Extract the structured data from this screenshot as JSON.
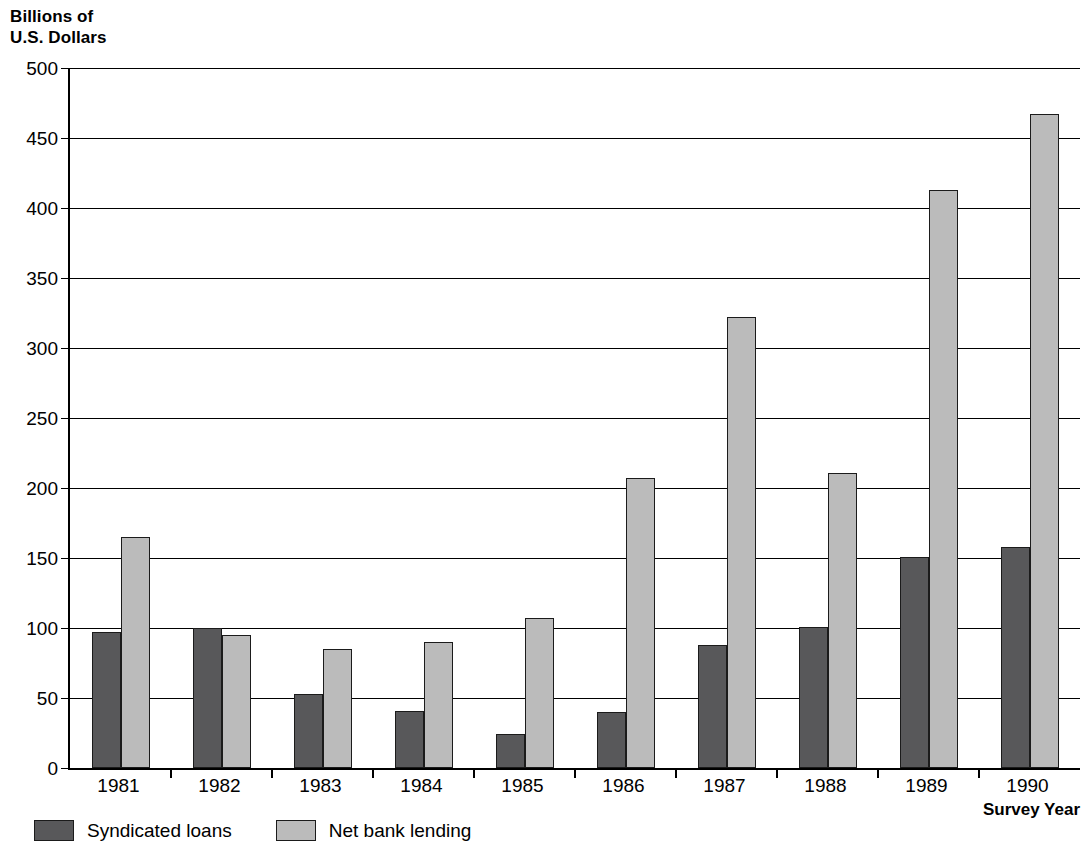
{
  "chart_data": {
    "type": "bar",
    "title": "Billions of\nU.S. Dollars",
    "ylabel": "Billions of U.S. Dollars",
    "xlabel": "Survey Year",
    "categories": [
      "1981",
      "1982",
      "1983",
      "1984",
      "1985",
      "1986",
      "1987",
      "1988",
      "1989",
      "1990"
    ],
    "series": [
      {
        "name": "Syndicated loans",
        "color": "#58585a",
        "values": [
          97,
          100,
          53,
          41,
          24,
          40,
          88,
          101,
          151,
          158
        ]
      },
      {
        "name": "Net bank lending",
        "color": "#bbbbbb",
        "values": [
          165,
          95,
          85,
          90,
          107,
          207,
          322,
          211,
          413,
          467
        ]
      }
    ],
    "ylim": [
      0,
      500
    ],
    "yticks": [
      0,
      50,
      100,
      150,
      200,
      250,
      300,
      350,
      400,
      450,
      500
    ],
    "ytick_labels": [
      "0",
      "50",
      "100",
      "150",
      "200",
      "250",
      "300",
      "350",
      "400",
      "450",
      "500"
    ],
    "grid": true,
    "legend_position": "bottom-left"
  },
  "legend": {
    "entries": [
      {
        "label": "Syndicated loans",
        "swatch": "dark"
      },
      {
        "label": "Net bank lending",
        "swatch": "light"
      }
    ]
  }
}
